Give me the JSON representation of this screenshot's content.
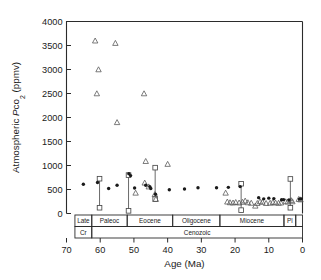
{
  "figure": {
    "background": "#ffffff",
    "foreground": "#1a1a1a"
  },
  "chart_data": {
    "type": "scatter",
    "title": "",
    "xlabel": "Age (Ma)",
    "ylabel": "Atmospheric Pco2 (ppmv)",
    "ylabel_parts": {
      "prefix": "Atmospheric ",
      "italic": "P",
      "sub_main": "co",
      "sub_digit": "2",
      "suffix": " (ppmv)"
    },
    "xlim": [
      70,
      0
    ],
    "ylim": [
      0,
      4000
    ],
    "x_reversed": true,
    "grid": false,
    "legend": "none",
    "xticks": [
      70,
      60,
      50,
      40,
      30,
      20,
      10,
      0
    ],
    "yticks": [
      0,
      500,
      1000,
      1500,
      2000,
      2500,
      3000,
      3500,
      4000
    ],
    "series": [
      {
        "name": "proxy-estimate-circle",
        "marker": "filled-circle",
        "color": "#1a1a1a",
        "points": [
          {
            "x": 65.0,
            "y": 610
          },
          {
            "x": 60.8,
            "y": 645
          },
          {
            "x": 57.5,
            "y": 520
          },
          {
            "x": 55.0,
            "y": 590
          },
          {
            "x": 51.5,
            "y": 830
          },
          {
            "x": 51.0,
            "y": 790
          },
          {
            "x": 49.8,
            "y": 530
          },
          {
            "x": 46.5,
            "y": 590
          },
          {
            "x": 45.3,
            "y": 560
          },
          {
            "x": 45.0,
            "y": 520
          },
          {
            "x": 43.6,
            "y": 400
          },
          {
            "x": 39.5,
            "y": 495
          },
          {
            "x": 35.0,
            "y": 510
          },
          {
            "x": 31.0,
            "y": 535
          },
          {
            "x": 25.5,
            "y": 535
          },
          {
            "x": 22.0,
            "y": 545
          },
          {
            "x": 18.5,
            "y": 560
          },
          {
            "x": 13.0,
            "y": 330
          },
          {
            "x": 11.5,
            "y": 305
          },
          {
            "x": 10.0,
            "y": 320
          },
          {
            "x": 8.5,
            "y": 310
          },
          {
            "x": 6.2,
            "y": 285
          },
          {
            "x": 5.6,
            "y": 290
          },
          {
            "x": 4.0,
            "y": 280
          },
          {
            "x": 0.9,
            "y": 300
          },
          {
            "x": 0.4,
            "y": 305
          }
        ]
      },
      {
        "name": "proxy-estimate-triangle",
        "marker": "open-triangle",
        "color": "#5a5a5a",
        "points": [
          {
            "x": 61.5,
            "y": 3600
          },
          {
            "x": 60.5,
            "y": 3000
          },
          {
            "x": 61.0,
            "y": 2500
          },
          {
            "x": 55.5,
            "y": 3550
          },
          {
            "x": 55.0,
            "y": 1900
          },
          {
            "x": 47.0,
            "y": 2500
          },
          {
            "x": 46.5,
            "y": 1090
          },
          {
            "x": 40.0,
            "y": 1030
          },
          {
            "x": 49.5,
            "y": 430
          },
          {
            "x": 46.8,
            "y": 640
          },
          {
            "x": 45.6,
            "y": 560
          },
          {
            "x": 43.8,
            "y": 400
          },
          {
            "x": 43.5,
            "y": 300
          },
          {
            "x": 22.8,
            "y": 430
          },
          {
            "x": 22.3,
            "y": 245
          },
          {
            "x": 21.5,
            "y": 230
          },
          {
            "x": 20.6,
            "y": 225
          },
          {
            "x": 19.8,
            "y": 235
          },
          {
            "x": 18.8,
            "y": 225
          },
          {
            "x": 17.8,
            "y": 240
          },
          {
            "x": 17.0,
            "y": 265
          },
          {
            "x": 16.2,
            "y": 230
          },
          {
            "x": 15.2,
            "y": 220
          },
          {
            "x": 14.0,
            "y": 160
          },
          {
            "x": 13.4,
            "y": 215
          },
          {
            "x": 12.6,
            "y": 250
          },
          {
            "x": 11.9,
            "y": 240
          },
          {
            "x": 10.8,
            "y": 215
          },
          {
            "x": 9.6,
            "y": 220
          },
          {
            "x": 8.8,
            "y": 235
          },
          {
            "x": 8.0,
            "y": 225
          },
          {
            "x": 7.1,
            "y": 220
          },
          {
            "x": 6.4,
            "y": 225
          },
          {
            "x": 5.0,
            "y": 250
          },
          {
            "x": 4.4,
            "y": 245
          },
          {
            "x": 3.4,
            "y": 275
          },
          {
            "x": 3.0,
            "y": 250
          },
          {
            "x": 1.1,
            "y": 300
          },
          {
            "x": 0.6,
            "y": 290
          }
        ]
      },
      {
        "name": "range-bar-square",
        "marker": "open-square-with-range",
        "color": "#4a4a4a",
        "points": [
          {
            "x": 60.2,
            "upper": 725,
            "lower": 120
          },
          {
            "x": 51.6,
            "upper": 800,
            "lower": 55
          },
          {
            "x": 43.7,
            "upper": 955,
            "lower": 300
          },
          {
            "x": 18.2,
            "upper": 620,
            "lower": 70
          },
          {
            "x": 3.6,
            "upper": 720,
            "lower": 120
          }
        ]
      }
    ],
    "timescale": {
      "epoch_row_label": "Epoch",
      "era_row_label": "Era",
      "epochs": [
        {
          "label": "Late",
          "start": 67.5,
          "end": 62.5
        },
        {
          "label": "Paleoc",
          "start": 62.5,
          "end": 52.0
        },
        {
          "label": "Eocene",
          "start": 52.0,
          "end": 38.5
        },
        {
          "label": "Oligocene",
          "start": 38.5,
          "end": 24.5
        },
        {
          "label": "Miocene",
          "start": 24.5,
          "end": 5.5
        },
        {
          "label": "Pl",
          "start": 5.5,
          "end": 2.0
        },
        {
          "label": "",
          "start": 2.0,
          "end": 0.0
        }
      ],
      "eras": [
        {
          "label": "Cr",
          "start": 67.5,
          "end": 62.5
        },
        {
          "label": "Cenozoic",
          "start": 62.5,
          "end": 0.0
        }
      ]
    }
  }
}
